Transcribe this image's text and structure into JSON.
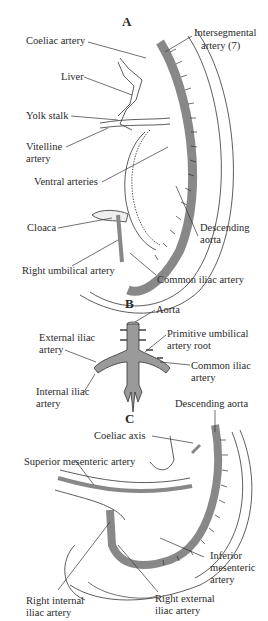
{
  "figure": {
    "panels": [
      {
        "id": "A",
        "labels": [
          "Coeliac artery",
          "Intersegmental artery (7)",
          "Liver",
          "Yolk stalk",
          "Vitelline artery",
          "Ventral arteries",
          "Cloaca",
          "Descending aorta",
          "Right umbilical artery",
          "Common iliac artery"
        ]
      },
      {
        "id": "B",
        "labels": [
          "Aorta",
          "External iliac artery",
          "Primitive umbilical artery root",
          "Common iliac artery",
          "Internal iliac artery"
        ]
      },
      {
        "id": "C",
        "labels": [
          "Descending aorta",
          "Coeliac axis",
          "Superior mesenteric artery",
          "Inferior mesenteric artery",
          "Right internal iliac artery",
          "Right external iliac artery"
        ]
      }
    ]
  },
  "a": {
    "title": "A",
    "coeliac": "Coeliac artery",
    "interseg1": "Intersegmental",
    "interseg2": "artery (7)",
    "liver": "Liver",
    "yolk": "Yolk stalk",
    "vitelline1": "Vitelline",
    "vitelline2": "artery",
    "ventral": "Ventral arteries",
    "cloaca": "Cloaca",
    "desc1": "Descending",
    "desc2": "aorta",
    "umbilical": "Right umbilical artery",
    "common_iliac": "Common iliac artery"
  },
  "b": {
    "title": "B",
    "aorta": "Aorta",
    "ext1": "External iliac",
    "ext2": "artery",
    "prim1": "Primitive umbilical",
    "prim2": "artery root",
    "common1": "Common iliac",
    "common2": "artery",
    "int1": "Internal iliac",
    "int2": "artery"
  },
  "c": {
    "title": "C",
    "desc": "Descending aorta",
    "coeliac": "Coeliac axis",
    "sma": "Superior mesenteric artery",
    "ima1": "Inferior",
    "ima2": "mesenteric",
    "ima3": "artery",
    "rint1": "Right internal",
    "rint2": "iliac artery",
    "rext1": "Right external",
    "rext2": "iliac artery"
  },
  "colors": {
    "artery_fill": "#9a9a9a",
    "line": "#333333",
    "background": "#ffffff"
  }
}
